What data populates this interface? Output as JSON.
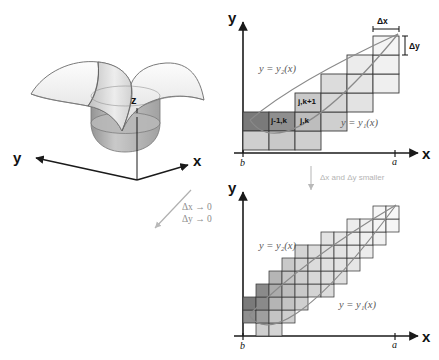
{
  "figure": {
    "panels": {
      "surface": {
        "name": "3d-surface-plot",
        "axis_x": "x",
        "axis_y": "y",
        "axis_z": "z"
      },
      "top_right": {
        "name": "coarse-grid-region",
        "axis_x": "x",
        "axis_y": "y",
        "x_start_label": "b",
        "x_end_label": "a",
        "upper_curve": "y = y₂(x)",
        "lower_curve": "y = y₁(x)",
        "delta_x": "Δx",
        "delta_y": "Δy",
        "cells": [
          {
            "label": "j,k+1"
          },
          {
            "label": "j-1,k"
          },
          {
            "label": "j,k"
          }
        ]
      },
      "bottom_right": {
        "name": "fine-grid-region",
        "axis_x": "x",
        "axis_y": "y",
        "x_start_label": "b",
        "x_end_label": "a",
        "upper_curve": "y = y₂(x)",
        "lower_curve": "y = y₁(x)"
      }
    },
    "annotations": {
      "limit_line_1": "Δx → 0",
      "limit_line_2": "Δy → 0",
      "refine_note": "Δx and Δy smaller"
    },
    "colors": {
      "cell_fill_light": "#e3e3e3",
      "cell_fill_mid": "#c9c9c9",
      "cell_fill_dark": "#9a9a9a",
      "cell_fill_darker": "#7a7a7a",
      "cell_stroke": "#3a3a3a",
      "curve_stroke": "#8a8a8a",
      "axis_stroke": "#1a1a1a",
      "surface_fill": "#efefef",
      "surface_stroke": "#6b6b6b"
    }
  }
}
